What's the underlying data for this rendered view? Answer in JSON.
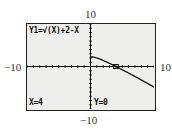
{
  "chart_data": {
    "type": "line",
    "title": "",
    "equation": "Y1=√(X)+2-X",
    "function": "sqrt(x)+2-x",
    "xlim": [
      -10,
      10
    ],
    "ylim": [
      -10,
      10
    ],
    "xscale": 1,
    "yscale": 1,
    "grid": false,
    "series": [
      {
        "name": "Y1",
        "x": [
          0,
          1,
          2,
          3,
          4,
          5,
          6,
          7,
          8,
          9,
          10
        ],
        "values": [
          2,
          2,
          1.41,
          0.73,
          0,
          -0.76,
          -1.55,
          -2.35,
          -3.17,
          -4,
          -4.84
        ]
      }
    ],
    "trace": {
      "x_label": "X=4",
      "y_label": "Y=0",
      "x": 4,
      "y": 0
    },
    "window_labels": {
      "ymax": "10",
      "ymin": "-10",
      "xmin": "-10",
      "xmax": "10"
    }
  },
  "labels": {
    "top": "10",
    "bottom": "−10",
    "left": "−10",
    "right": "10"
  },
  "screen": {
    "equation_text": "Y1=√(X)+2-X",
    "x_readout": "X=4",
    "y_readout": "Y=0"
  }
}
